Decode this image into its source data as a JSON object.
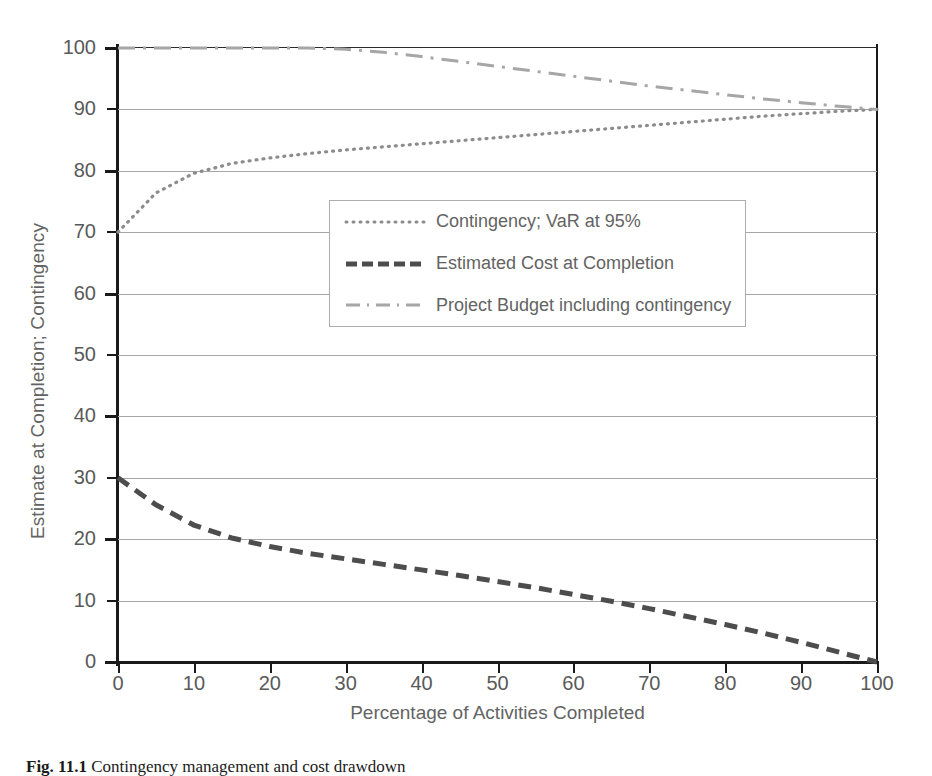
{
  "figure": {
    "caption_label": "Fig. 11.1",
    "caption_text": "Contingency management and cost drawdown"
  },
  "chart_data": {
    "type": "line",
    "title": "",
    "xlabel": "Percentage of Activities Completed",
    "ylabel": "Estimate at Completion; Contingency",
    "xlim": [
      0,
      100
    ],
    "ylim": [
      0,
      100
    ],
    "xticks": [
      0,
      10,
      20,
      30,
      40,
      50,
      60,
      70,
      80,
      90,
      100
    ],
    "yticks": [
      0,
      10,
      20,
      30,
      40,
      50,
      60,
      70,
      80,
      90,
      100
    ],
    "grid": "horizontal",
    "legend_position": "center-right",
    "x": [
      0,
      5,
      10,
      15,
      20,
      25,
      30,
      35,
      40,
      45,
      50,
      55,
      60,
      65,
      70,
      75,
      80,
      85,
      90,
      95,
      100
    ],
    "series": [
      {
        "name": "Contingency; VaR at 95%",
        "style": "dotted",
        "color": "#8c8c8c",
        "values": [
          70.0,
          76.4,
          79.6,
          81.2,
          82.1,
          82.8,
          83.4,
          83.9,
          84.4,
          84.9,
          85.4,
          85.9,
          86.4,
          86.9,
          87.4,
          87.9,
          88.4,
          88.9,
          89.3,
          89.7,
          90.0
        ]
      },
      {
        "name": "Estimated Cost at Completion",
        "style": "dashed",
        "color": "#4d4d4d",
        "values": [
          30.0,
          25.6,
          22.3,
          20.2,
          18.8,
          17.7,
          16.8,
          15.9,
          15.0,
          14.1,
          13.1,
          12.1,
          11.0,
          9.9,
          8.7,
          7.4,
          6.1,
          4.7,
          3.2,
          1.6,
          0.0
        ]
      },
      {
        "name": "Project Budget including contingency",
        "style": "dash-dot",
        "color": "#a6a6a6",
        "values": [
          100.0,
          100.0,
          100.0,
          100.0,
          100.0,
          100.0,
          99.8,
          99.3,
          98.6,
          97.8,
          97.0,
          96.2,
          95.4,
          94.6,
          93.8,
          93.1,
          92.4,
          91.7,
          91.1,
          90.5,
          90.0
        ]
      }
    ]
  },
  "legend": {
    "items": [
      {
        "label": "Contingency; VaR at 95%"
      },
      {
        "label": "Estimated Cost at Completion"
      },
      {
        "label": "Project Budget including contingency"
      }
    ]
  }
}
